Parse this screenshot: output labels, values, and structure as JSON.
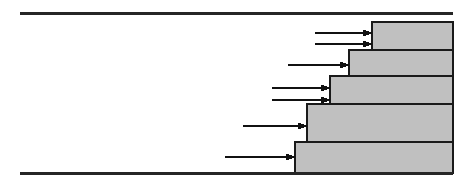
{
  "diagram": {
    "title": "Staircase step profile with horizontal flow arrows",
    "canvas": {
      "width": 466,
      "height": 186,
      "background": "#ffffff"
    },
    "style": {
      "step_fill": "#c0c0c0",
      "step_stroke": "#1a1a1a",
      "step_stroke_width": 1.4,
      "boundary_color": "#262626",
      "boundary_width": 3,
      "arrow_color": "#111111",
      "arrow_width": 1.2
    },
    "boundaries": [
      {
        "name": "top-boundary-line",
        "x1": 20,
        "y1": 13,
        "x2": 453,
        "y2": 13
      },
      {
        "name": "bottom-boundary-line",
        "x1": 20,
        "y1": 173,
        "x2": 453,
        "y2": 173
      }
    ],
    "steps": [
      {
        "name": "step-1-top",
        "index": 1,
        "x": 372,
        "y": 22,
        "width": 81,
        "height": 28
      },
      {
        "name": "step-2",
        "index": 2,
        "x": 349,
        "y": 50,
        "width": 104,
        "height": 26
      },
      {
        "name": "step-3",
        "index": 3,
        "x": 330,
        "y": 76,
        "width": 123,
        "height": 28
      },
      {
        "name": "step-4",
        "index": 4,
        "x": 307,
        "y": 104,
        "width": 146,
        "height": 38
      },
      {
        "name": "step-5-bottom",
        "index": 5,
        "x": 295,
        "y": 142,
        "width": 158,
        "height": 31
      }
    ],
    "arrows": [
      {
        "name": "arrow-1",
        "x1": 315,
        "y": 33,
        "x2": 372,
        "target_step": 1
      },
      {
        "name": "arrow-2",
        "x1": 315,
        "y": 44,
        "x2": 372,
        "target_step": 1
      },
      {
        "name": "arrow-3",
        "x1": 288,
        "y": 65,
        "x2": 349,
        "target_step": 2
      },
      {
        "name": "arrow-4",
        "x1": 272,
        "y": 88,
        "x2": 330,
        "target_step": 3
      },
      {
        "name": "arrow-5",
        "x1": 272,
        "y": 100,
        "x2": 330,
        "target_step": 3
      },
      {
        "name": "arrow-6",
        "x1": 243,
        "y": 126,
        "x2": 307,
        "target_step": 4
      },
      {
        "name": "arrow-7",
        "x1": 225,
        "y": 157,
        "x2": 295,
        "target_step": 5
      }
    ]
  }
}
